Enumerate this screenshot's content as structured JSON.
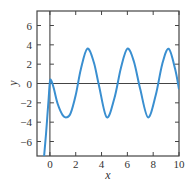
{
  "chart_data": {
    "type": "line",
    "title": "",
    "xlabel": "x",
    "ylabel": "y",
    "xlim": [
      -1,
      10
    ],
    "ylim": [
      -7.5,
      7.5
    ],
    "xticks": [
      0,
      2,
      4,
      6,
      8,
      10
    ],
    "yticks": [
      -6,
      -4,
      -2,
      0,
      2,
      4,
      6
    ],
    "xtick_labels": [
      "0",
      "2",
      "4",
      "6",
      "8",
      "10"
    ],
    "ytick_labels": [
      "−6",
      "−4",
      "−2",
      "0",
      "2",
      "4",
      "6"
    ],
    "grid": false,
    "legend": null,
    "reference_lines": {
      "y0_horizontal": true,
      "x0_vertical": true
    },
    "series": [
      {
        "name": "y(x)",
        "color": "#3a8fd0",
        "description": "Decaying transient plus steady sinusoid, amplitude ~3.5, period ~pi",
        "x": [
          -0.45,
          -0.3,
          -0.2,
          -0.1,
          0.0,
          0.1,
          0.3,
          0.6,
          1.0,
          1.3,
          1.6,
          2.0,
          2.4,
          2.9,
          3.4,
          3.8,
          4.4,
          5.0,
          5.5,
          6.0,
          6.5,
          7.0,
          7.6,
          8.2,
          8.7,
          9.2,
          9.7,
          10.0
        ],
        "values": [
          -7.5,
          -5.2,
          -3.4,
          -1.6,
          0.2,
          0.3,
          -0.5,
          -2.1,
          -3.3,
          -3.5,
          -3.1,
          -1.2,
          1.5,
          3.6,
          2.2,
          -0.2,
          -3.5,
          -1.5,
          1.6,
          3.6,
          2.3,
          -0.6,
          -3.5,
          -1.2,
          2.0,
          3.6,
          1.5,
          -0.6
        ]
      }
    ]
  }
}
